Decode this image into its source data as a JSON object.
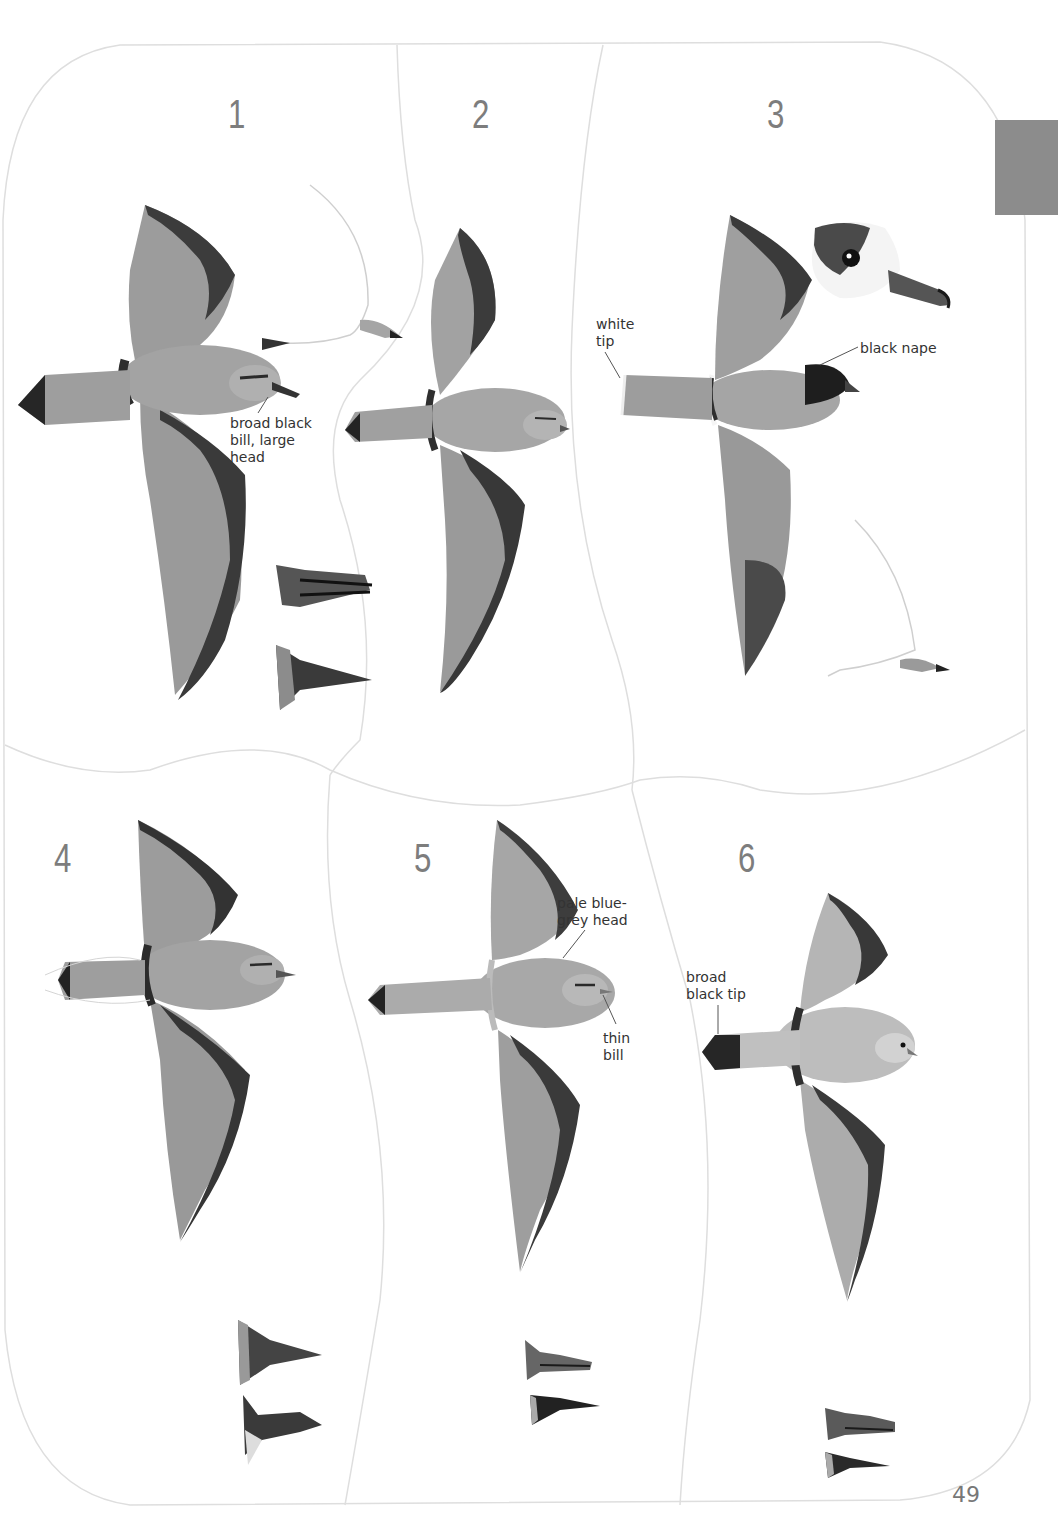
{
  "page": {
    "number": "49",
    "thumb_tab_color": "#8c8c8c",
    "panel_line_color": "#dcdcdc",
    "text_color": "#333333",
    "plate_number_color": "#7d7d7d"
  },
  "plates": [
    {
      "id": 1,
      "number": "1",
      "annotations": [
        {
          "text": "broad black\nbill, large\nhead",
          "target": "bill"
        }
      ],
      "extras": [
        "side-view-in-flight",
        "bill-side-view",
        "bill-top-view"
      ]
    },
    {
      "id": 2,
      "number": "2",
      "annotations": [],
      "extras": []
    },
    {
      "id": 3,
      "number": "3",
      "annotations": [
        {
          "text": "white\ntip",
          "target": "tail"
        },
        {
          "text": "black nape",
          "target": "nape"
        }
      ],
      "extras": [
        "head-closeup",
        "side-view-in-flight"
      ]
    },
    {
      "id": 4,
      "number": "4",
      "annotations": [],
      "extras": [
        "bill-top-view",
        "bill-side-view"
      ]
    },
    {
      "id": 5,
      "number": "5",
      "annotations": [
        {
          "text": "pale blue-\ngrey head",
          "target": "head"
        },
        {
          "text": "thin\nbill",
          "target": "bill"
        }
      ],
      "extras": [
        "bill-side-view",
        "bill-top-view"
      ]
    },
    {
      "id": 6,
      "number": "6",
      "annotations": [
        {
          "text": "broad\nblack tip",
          "target": "tail"
        }
      ],
      "extras": [
        "bill-side-view",
        "bill-top-view"
      ]
    }
  ]
}
